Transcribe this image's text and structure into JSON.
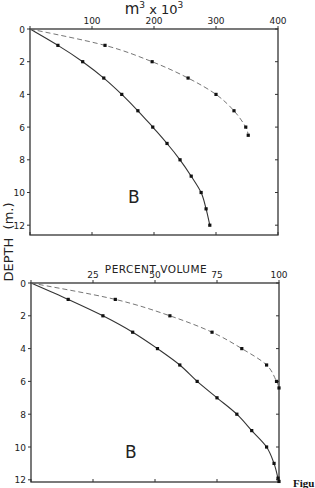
{
  "figure": {
    "y_axis_label": "DEPTH  (m.)",
    "caption_fragment": "Figu"
  },
  "chart_data": [
    {
      "type": "line",
      "panel_label": "B",
      "title": "",
      "xlabel": "m³ x 10³",
      "xlabel_parts": {
        "base": "m",
        "sup1": "3",
        "mid": " x 10",
        "sup2": "3"
      },
      "ylabel": "DEPTH (m.)",
      "x_axis_position": "top",
      "xlim": [
        0,
        400
      ],
      "ylim": [
        12.6,
        0
      ],
      "xticks": [
        0,
        100,
        200,
        300,
        400
      ],
      "xtick_labels": [
        "",
        "100",
        "200",
        "300",
        "400"
      ],
      "yticks": [
        0,
        2,
        4,
        6,
        8,
        10,
        12
      ],
      "ytick_labels": [
        "0",
        "2",
        "4",
        "6",
        "8",
        "10",
        "12"
      ],
      "grid": false,
      "legend": null,
      "series": [
        {
          "name": "solid",
          "style": "solid",
          "markers": true,
          "points": [
            [
              0,
              0
            ],
            [
              45,
              1
            ],
            [
              85,
              2
            ],
            [
              119,
              3
            ],
            [
              148,
              4
            ],
            [
              174,
              5
            ],
            [
              198,
              6
            ],
            [
              221,
              7
            ],
            [
              242,
              8
            ],
            [
              260,
              9
            ],
            [
              276,
              10
            ],
            [
              284,
              11
            ],
            [
              290,
              12
            ]
          ]
        },
        {
          "name": "dashed",
          "style": "dashed",
          "markers": true,
          "points": [
            [
              0,
              0
            ],
            [
              121,
              1
            ],
            [
              197,
              2
            ],
            [
              255,
              3
            ],
            [
              300,
              4
            ],
            [
              329,
              5
            ],
            [
              348,
              6
            ],
            [
              352,
              6.5
            ]
          ]
        }
      ]
    },
    {
      "type": "line",
      "panel_label": "B",
      "title": "",
      "xlabel": "PERCENT VOLUME",
      "ylabel": "DEPTH (m.)",
      "x_axis_position": "top",
      "xlim": [
        0,
        100
      ],
      "ylim": [
        12.1,
        0
      ],
      "xticks": [
        0,
        25,
        50,
        75,
        100
      ],
      "xtick_labels": [
        "",
        "25",
        "50",
        "75",
        "100"
      ],
      "yticks": [
        0,
        2,
        4,
        6,
        8,
        10,
        12
      ],
      "ytick_labels": [
        "0",
        "2",
        "4",
        "6",
        "8",
        "10",
        "12"
      ],
      "grid": false,
      "legend": null,
      "series": [
        {
          "name": "solid",
          "style": "solid",
          "markers": true,
          "points": [
            [
              0,
              0
            ],
            [
              15,
              1
            ],
            [
              29,
              2
            ],
            [
              41,
              3
            ],
            [
              51,
              4
            ],
            [
              60,
              5
            ],
            [
              67,
              6
            ],
            [
              75,
              7
            ],
            [
              83,
              8
            ],
            [
              89,
              9
            ],
            [
              95,
              10
            ],
            [
              98,
              11
            ],
            [
              99.6,
              11.9
            ],
            [
              100,
              12.1
            ]
          ]
        },
        {
          "name": "dashed",
          "style": "dashed",
          "markers": true,
          "points": [
            [
              0,
              0
            ],
            [
              34,
              1
            ],
            [
              56,
              2
            ],
            [
              73,
              3
            ],
            [
              85,
              4
            ],
            [
              95,
              5
            ],
            [
              99,
              6
            ],
            [
              100,
              6.4
            ]
          ]
        }
      ]
    }
  ]
}
